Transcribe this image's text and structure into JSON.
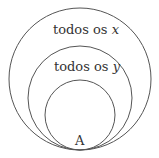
{
  "diagram": {
    "type": "nested-euler-circles",
    "stroke_color": "#555555",
    "text_color": "#333333",
    "sets": [
      {
        "label": "todos os",
        "variable": "x",
        "level": "outer"
      },
      {
        "label": "todos os",
        "variable": "y",
        "level": "middle"
      },
      {
        "label": "A",
        "variable": "",
        "level": "inner"
      }
    ]
  }
}
